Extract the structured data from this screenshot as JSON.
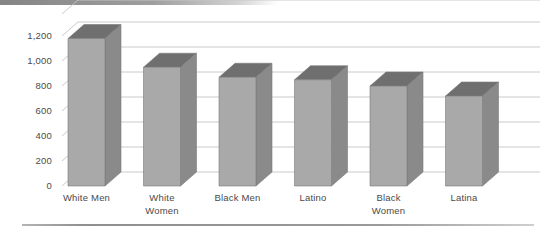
{
  "chart_data": {
    "type": "bar",
    "title": "",
    "subtitle": "",
    "xlabel": "",
    "ylabel": "",
    "categories": [
      "White Men",
      "White\nWomen",
      "Black Men",
      "Latino",
      "Black\nWomen",
      "Latina"
    ],
    "values": [
      1180,
      950,
      870,
      850,
      800,
      720
    ],
    "ylim": [
      0,
      1200
    ],
    "ytick_labels": [
      "0",
      "200",
      "400",
      "600",
      "800",
      "1,000",
      "1,200"
    ],
    "ytick_values": [
      0,
      200,
      400,
      600,
      800,
      1000,
      1200
    ],
    "grid": true,
    "legend": "none",
    "style": "3d-column",
    "colors": {
      "bar_front": "#a9a9a9",
      "bar_side": "#8a8a8a",
      "bar_top": "#6f6f6f",
      "gridline": "#c8c8c8",
      "text": "#4a4a4a",
      "background": "#ffffff"
    }
  }
}
